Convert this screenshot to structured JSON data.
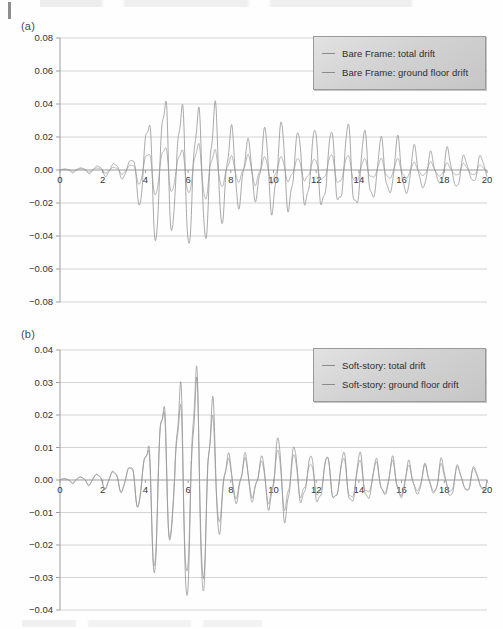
{
  "figure": {
    "panels": [
      {
        "id": "a",
        "label": "(a)",
        "legend": {
          "items": [
            {
              "label": "Bare Frame: total drift",
              "color": "#8b8b8b"
            },
            {
              "label": "Bare Frame: ground floor drift",
              "color": "#8b8b8b"
            }
          ]
        }
      },
      {
        "id": "b",
        "label": "(b)",
        "legend": {
          "items": [
            {
              "label": "Soft-story: total drift",
              "color": "#8b8b8b"
            },
            {
              "label": "Soft-story: ground floor drift",
              "color": "#8b8b8b"
            }
          ]
        }
      }
    ]
  },
  "chart_data": [
    {
      "type": "line",
      "panel": "a",
      "title": "(a)",
      "xlabel": "",
      "ylabel": "",
      "xlim": [
        0,
        20
      ],
      "ylim": [
        -0.08,
        0.08
      ],
      "xticks": [
        0,
        2,
        4,
        6,
        8,
        10,
        12,
        14,
        16,
        18,
        20
      ],
      "yticks": [
        -0.08,
        -0.06,
        -0.04,
        -0.02,
        0.0,
        0.02,
        0.04,
        0.06,
        0.08
      ],
      "ytick_labels": [
        "-0.08",
        "-0.06",
        "-0.04",
        "-0.02",
        "0.00",
        "0.02",
        "0.04",
        "0.06",
        "0.08"
      ],
      "xtick_labels": [
        "0",
        "2",
        "4",
        "6",
        "8",
        "10",
        "12",
        "14",
        "16",
        "18",
        "20"
      ],
      "grid": "horizontal",
      "legend_position": "top-right",
      "series": [
        {
          "name": "Bare Frame: total drift",
          "color": "#8b8b8b",
          "description": "Large-amplitude damped oscillation, peak 0.054 near t=5.0, minimum -0.058 near t=5.2, slow decay to +/-0.008 at t=20",
          "envelope_t": [
            0,
            1.0,
            2.0,
            3.0,
            3.5,
            4.0,
            4.4,
            4.8,
            5.0,
            5.4,
            6.0,
            6.6,
            7.0,
            7.6,
            8.2,
            9.0,
            10.0,
            11.0,
            12.0,
            13.0,
            14.0,
            15.0,
            16.0,
            17.0,
            18.0,
            19.0,
            20.0
          ],
          "envelope_a": [
            0.0004,
            0.0018,
            0.003,
            0.0042,
            0.0075,
            0.032,
            0.04,
            0.054,
            0.057,
            0.033,
            0.036,
            0.043,
            0.046,
            0.03,
            0.0205,
            0.019,
            0.025,
            0.0195,
            0.0205,
            0.0215,
            0.0205,
            0.016,
            0.0135,
            0.0115,
            0.01,
            0.009,
            0.008
          ],
          "frequency_hz": 1.28
        },
        {
          "name": "Bare Frame: ground floor drift",
          "color": "#9a9a9a",
          "description": "Same phase, roughly 35% of the total-drift amplitude; peak about 0.019, minimum about -0.021",
          "envelope_t": [
            0,
            1.0,
            2.0,
            3.0,
            3.5,
            4.0,
            4.4,
            4.8,
            5.0,
            5.4,
            6.0,
            6.6,
            7.0,
            7.6,
            8.2,
            9.0,
            10.0,
            11.0,
            12.0,
            13.0,
            14.0,
            15.0,
            16.0,
            17.0,
            18.0,
            19.0,
            20.0
          ],
          "envelope_a": [
            0.0002,
            0.0008,
            0.0013,
            0.002,
            0.0035,
            0.0115,
            0.014,
            0.0175,
            0.0185,
            0.012,
            0.013,
            0.015,
            0.016,
            0.011,
            0.0075,
            0.007,
            0.009,
            0.0072,
            0.0076,
            0.008,
            0.0076,
            0.006,
            0.005,
            0.0043,
            0.0038,
            0.0034,
            0.003
          ],
          "frequency_hz": 1.28
        }
      ]
    },
    {
      "type": "line",
      "panel": "b",
      "title": "(b)",
      "xlabel": "",
      "ylabel": "",
      "xlim": [
        0,
        20
      ],
      "ylim": [
        -0.04,
        0.04
      ],
      "xticks": [
        0,
        2,
        4,
        6,
        8,
        10,
        12,
        14,
        16,
        18,
        20
      ],
      "yticks": [
        -0.04,
        -0.03,
        -0.02,
        -0.01,
        0.0,
        0.01,
        0.02,
        0.03,
        0.04
      ],
      "ytick_labels": [
        "-0.04",
        "-0.03",
        "-0.02",
        "-0.01",
        "0.00",
        "0.01",
        "0.02",
        "0.03",
        "0.04"
      ],
      "xtick_labels": [
        "0",
        "2",
        "4",
        "6",
        "8",
        "10",
        "12",
        "14",
        "16",
        "18",
        "20"
      ],
      "grid": "horizontal",
      "legend_position": "top-right",
      "series": [
        {
          "name": "Soft-story: total drift",
          "color": "#8b8b8b",
          "description": "Burst of large oscillation between t=4 and t=7.3, peak 0.0362 near t=6.6, minimum -0.0325 near t=6.4, then low-amplitude tail under 0.012",
          "envelope_t": [
            0,
            1.0,
            2.0,
            2.6,
            3.0,
            3.4,
            3.8,
            4.1,
            4.5,
            4.9,
            5.3,
            5.7,
            6.1,
            6.5,
            6.9,
            7.2,
            7.6,
            8.0,
            8.6,
            9.2,
            10.0,
            10.6,
            11.4,
            12.2,
            13.0,
            14.0,
            15.0,
            16.0,
            17.0,
            18.0,
            19.0,
            20.0
          ],
          "envelope_a": [
            0.0003,
            0.0012,
            0.0022,
            0.0028,
            0.003,
            0.0048,
            0.0082,
            0.0115,
            0.0335,
            0.0305,
            0.0165,
            0.0278,
            0.03,
            0.0362,
            0.03,
            0.0228,
            0.0122,
            0.0055,
            0.0072,
            0.005,
            0.0098,
            0.0112,
            0.0058,
            0.0068,
            0.0062,
            0.007,
            0.0048,
            0.005,
            0.0046,
            0.0048,
            0.004,
            0.0038
          ],
          "frequency_hz": 1.3
        },
        {
          "name": "Soft-story: ground floor drift",
          "color": "#9a9a9a",
          "description": "Nearly coincident with total drift (soft-story concentrates drift at ground floor); about 92% of total amplitude",
          "envelope_t": [
            0,
            1.0,
            2.0,
            2.6,
            3.0,
            3.4,
            3.8,
            4.1,
            4.5,
            4.9,
            5.3,
            5.7,
            6.1,
            6.5,
            6.9,
            7.2,
            7.6,
            8.0,
            8.6,
            9.2,
            10.0,
            10.6,
            11.4,
            12.2,
            13.0,
            14.0,
            15.0,
            16.0,
            17.0,
            18.0,
            19.0,
            20.0
          ],
          "envelope_a": [
            0.00028,
            0.0011,
            0.002,
            0.0026,
            0.0028,
            0.0044,
            0.0076,
            0.0106,
            0.0308,
            0.0281,
            0.0152,
            0.0256,
            0.0276,
            0.0333,
            0.0276,
            0.021,
            0.0112,
            0.0051,
            0.0066,
            0.0046,
            0.009,
            0.0103,
            0.0053,
            0.0063,
            0.0057,
            0.0064,
            0.0044,
            0.0046,
            0.0042,
            0.0044,
            0.0037,
            0.0035
          ],
          "frequency_hz": 1.3
        }
      ]
    }
  ],
  "style": {
    "grid_color": "#c9c9c9",
    "axis_color": "#9d9d9d",
    "tick_text_color": "#333333",
    "legend_bg": "#d6d6d6",
    "legend_border": "#9a9a9a",
    "background": "#fefefe"
  }
}
